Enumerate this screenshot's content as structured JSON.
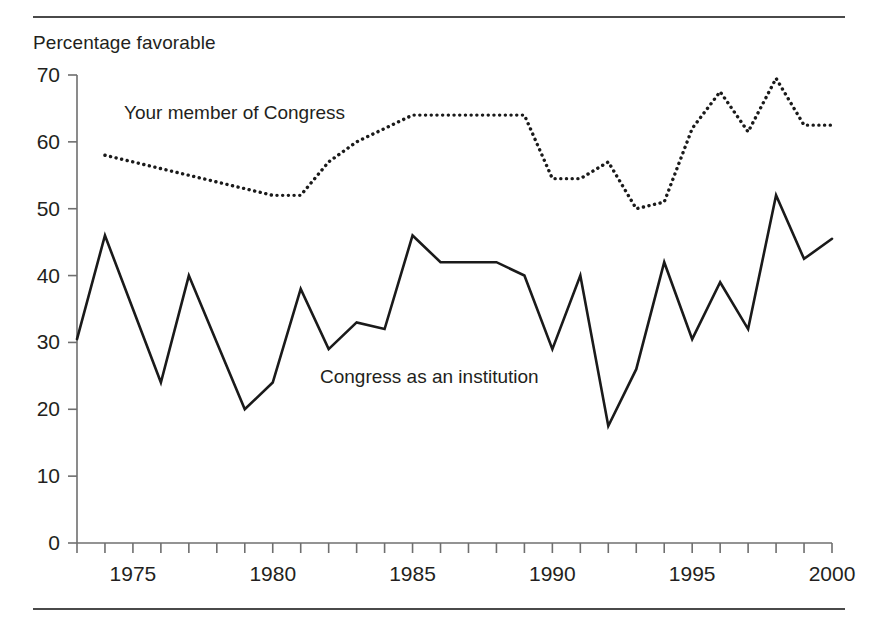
{
  "figure": {
    "top_rule": "",
    "bottom_rule": ""
  },
  "chart_data": {
    "type": "line",
    "title": "",
    "ylabel": "Percentage favorable",
    "xlabel": "",
    "ylim": [
      0,
      70
    ],
    "xlim": [
      1973,
      2000
    ],
    "yticks": [
      0,
      10,
      20,
      30,
      40,
      50,
      60,
      70
    ],
    "ytick_labels": [
      "0",
      "10",
      "20",
      "30",
      "40",
      "50",
      "60",
      "70"
    ],
    "xticks": [
      1975,
      1980,
      1985,
      1990,
      1995,
      2000
    ],
    "xtick_labels": [
      "1975",
      "1980",
      "1985",
      "1990",
      "1995",
      "2000"
    ],
    "x_minor_tick_interval": 1,
    "grid": false,
    "legend_position": "inline-annotations",
    "x": [
      1973,
      1974,
      1975,
      1976,
      1977,
      1978,
      1979,
      1980,
      1981,
      1982,
      1983,
      1984,
      1985,
      1986,
      1987,
      1988,
      1989,
      1990,
      1991,
      1992,
      1993,
      1994,
      1995,
      1996,
      1997,
      1998,
      1999,
      2000
    ],
    "series": [
      {
        "name": "Your member of Congress",
        "style": "dotted",
        "color": "#1a1a1a",
        "x": [
          1974,
          1975,
          1976,
          1977,
          1978,
          1979,
          1980,
          1981,
          1982,
          1983,
          1984,
          1985,
          1986,
          1987,
          1988,
          1989,
          1990,
          1991,
          1992,
          1993,
          1994,
          1995,
          1996,
          1997,
          1998,
          1999,
          2000
        ],
        "values": [
          58,
          57,
          56,
          55,
          54,
          53,
          52,
          52,
          57,
          60,
          62,
          64,
          64,
          64,
          64,
          64,
          54.5,
          54.5,
          57,
          50,
          51,
          62,
          67.5,
          61.5,
          69.5,
          62.5,
          62.5
        ]
      },
      {
        "name": "Congress as an institution",
        "style": "solid",
        "color": "#1a1a1a",
        "x": [
          1973,
          1974,
          1975,
          1976,
          1977,
          1978,
          1979,
          1980,
          1981,
          1982,
          1983,
          1984,
          1985,
          1986,
          1987,
          1988,
          1989,
          1990,
          1991,
          1992,
          1993,
          1994,
          1995,
          1996,
          1997,
          1998,
          1999,
          2000
        ],
        "values": [
          30.5,
          46,
          35,
          24,
          40,
          30,
          20,
          24,
          38,
          29,
          33,
          32,
          46,
          42,
          42,
          42,
          40,
          29,
          40,
          17.5,
          26,
          42,
          30.5,
          39,
          32,
          52,
          42.5,
          45.5
        ]
      }
    ],
    "annotations": [
      {
        "text": "Your member of Congress",
        "x": 1975.7,
        "y": 65.5
      },
      {
        "text": "Congress as an institution",
        "x": 1982.7,
        "y": 26
      }
    ]
  }
}
